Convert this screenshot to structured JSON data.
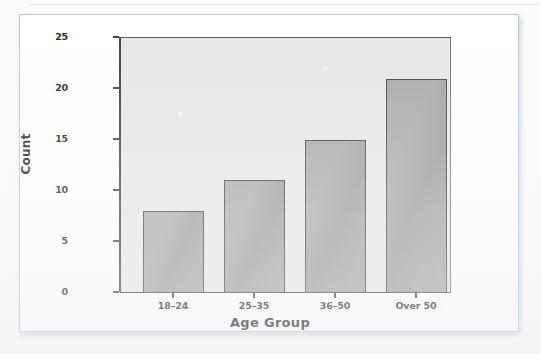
{
  "chart_data": {
    "type": "bar",
    "title": "",
    "categories": [
      "18–24",
      "25–35",
      "36–50",
      "Over 50"
    ],
    "values": [
      8,
      11,
      15,
      21
    ],
    "series": [
      {
        "name": "Count",
        "values": [
          8,
          11,
          15,
          21
        ]
      }
    ],
    "xlabel": "Age Group",
    "ylabel": "Count",
    "ylim": [
      0,
      25
    ],
    "yticks": [
      0,
      5,
      10,
      15,
      20,
      25
    ],
    "ytick_labels": [
      "0",
      "5",
      "10",
      "15",
      "20",
      "25"
    ],
    "grid": false,
    "legend": false,
    "legend_position": "none",
    "bar_color": "#9d9da0",
    "bar_edge_color": "#3c3c3e",
    "plot_background": "#e7e7ea",
    "figure_background": "#ffffff",
    "axis_color": "#3a3a3a"
  }
}
